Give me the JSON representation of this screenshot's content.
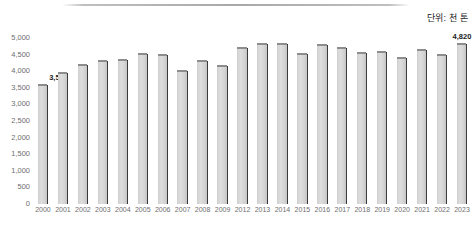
{
  "unit_note": "단위: 천 톤",
  "chart_data": {
    "type": "bar",
    "title": "",
    "subtitle": "",
    "xlabel": "",
    "ylabel": "",
    "unit": "단위: 천 톤",
    "grid": false,
    "legend": "none",
    "ylim": [
      0,
      5000
    ],
    "ytick_labels": [
      "5,000",
      "4,500",
      "4,000",
      "3,500",
      "3,000",
      "2,500",
      "2,000",
      "1,500",
      "1,000",
      "500",
      "0"
    ],
    "ytick_values": [
      5000,
      4500,
      4000,
      3500,
      3000,
      2500,
      2000,
      1500,
      1000,
      500,
      0
    ],
    "categories": [
      "2000",
      "2001",
      "2002",
      "2003",
      "2004",
      "2005",
      "2006",
      "2007",
      "2008",
      "2009",
      "2012",
      "2013",
      "2014",
      "2015",
      "2016",
      "2017",
      "2018",
      "2019",
      "2020",
      "2021",
      "2022",
      "2023"
    ],
    "values": [
      3590,
      3960,
      4190,
      4300,
      4350,
      4530,
      4490,
      4020,
      4320,
      4160,
      4700,
      4810,
      4810,
      4510,
      4790,
      4690,
      4560,
      4590,
      4400,
      4640,
      4480,
      4820
    ],
    "data_labels": [
      {
        "category": "2000",
        "text": "3,590"
      },
      {
        "category": "2023",
        "text": "4,820"
      }
    ],
    "series": [
      {
        "name": "",
        "values": [
          3590,
          3960,
          4190,
          4300,
          4350,
          4530,
          4490,
          4020,
          4320,
          4160,
          4700,
          4810,
          4810,
          4510,
          4790,
          4690,
          4560,
          4590,
          4400,
          4640,
          4480,
          4820
        ]
      }
    ],
    "colors": {
      "bar_face": "#d9d9d9",
      "bar_edge": "#3a3a3a",
      "bar_top": "#8d8d8d",
      "axis_text": "#6e6e6e",
      "label_text": "#1a1a1a",
      "rule": "#a8a8a8"
    }
  }
}
